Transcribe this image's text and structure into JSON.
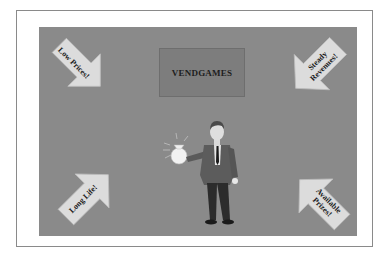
{
  "title": "VENDGAMES",
  "arrows": {
    "top_left": "Low Prices!",
    "top_right_line1": "Steady",
    "top_right_line2": "Revenues!",
    "bottom_left": "Long Life!",
    "bottom_right_line1": "Available",
    "bottom_right_line2": "Prizes!"
  },
  "figure": {
    "icon": "businessman-holding-money-bag-icon"
  },
  "colors": {
    "panel": "#8a8a8a",
    "title_box": "#7d7d7d",
    "arrow_fill": "#dcdcdc"
  }
}
